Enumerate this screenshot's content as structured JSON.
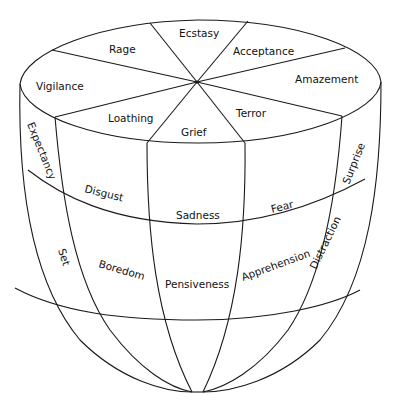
{
  "top_ring": {
    "labels": {
      "rage": "Rage",
      "ecstasy": "Ecstasy",
      "acceptance": "Acceptance",
      "amazement": "Amazement",
      "terror": "Terror",
      "grief": "Grief",
      "loathing": "Loathing",
      "vigilance": "Vigilance"
    }
  },
  "middle_ring": {
    "labels": {
      "expectancy": "Expectancy",
      "disgust": "Disgust",
      "sadness": "Sadness",
      "fear": "Fear",
      "surprise": "Surprise"
    }
  },
  "lower_ring": {
    "labels": {
      "set": "Set",
      "boredom": "Boredom",
      "pensiveness": "Pensiveness",
      "apprehension": "Apprehension",
      "distraction": "Distraction"
    }
  },
  "colors": {
    "line": "#1a1a1a",
    "text": "#111111",
    "background": "#ffffff"
  }
}
